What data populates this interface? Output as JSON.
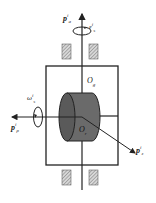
{
  "diagram": {
    "type": "gyroscope-frame-schematic",
    "colors": {
      "line": "#222222",
      "cylinder_body": "#6a6a6a",
      "cylinder_face": "#555555",
      "hatch": "#888888",
      "background": "#ffffff"
    },
    "labels": {
      "top_axis": {
        "base": "p",
        "sup": "i",
        "sub": "a"
      },
      "top_rotation": {
        "base": "ε",
        "sup": "i",
        "sub": "s"
      },
      "left_rotation": {
        "base": "ω",
        "sup": "i",
        "sub": "s"
      },
      "left_axis": {
        "base": "p",
        "sup": "i",
        "sub": "ρ"
      },
      "diag_axis": {
        "base": "p",
        "sup": "i",
        "sub": "z"
      },
      "frame_origin": {
        "base": "O",
        "sub": "g"
      },
      "rotor_origin": {
        "base": "O",
        "sub": "r"
      }
    }
  }
}
